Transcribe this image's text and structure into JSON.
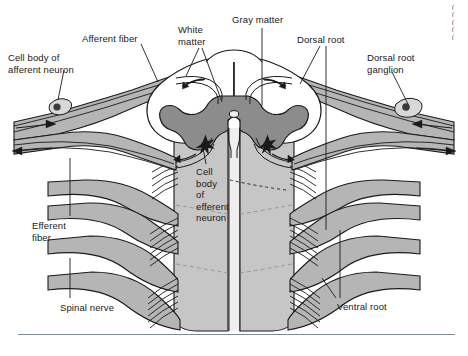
{
  "figure": {
    "background_color": "#ffffff",
    "width": 468,
    "height": 356
  },
  "colors": {
    "gray_matter": "#8c8c8c",
    "white_matter": "#ffffff",
    "nerve_fill": "#b5b5b5",
    "cord_body": "#c6c6c6",
    "outline": "#1a1a1a",
    "rule": "#7e8a91",
    "text": "#1a1a1a"
  },
  "labels": [
    {
      "id": "cell-body-afferent-neuron",
      "text": "Cell body of\nafferent neuron",
      "x": 8,
      "y": 52,
      "align": "left"
    },
    {
      "id": "afferent-fiber",
      "text": "Afferent fiber",
      "x": 82,
      "y": 33,
      "align": "left"
    },
    {
      "id": "white-matter",
      "text": "White\nmatter",
      "x": 178,
      "y": 24,
      "align": "left"
    },
    {
      "id": "gray-matter",
      "text": "Gray matter",
      "x": 232,
      "y": 14,
      "align": "left"
    },
    {
      "id": "dorsal-root",
      "text": "Dorsal root",
      "x": 297,
      "y": 34,
      "align": "left"
    },
    {
      "id": "dorsal-root-ganglion",
      "text": "Dorsal root\nganglion",
      "x": 367,
      "y": 52,
      "align": "left"
    },
    {
      "id": "cell-body-efferent-neuron",
      "text": "Cell\nbody\nof\nefferent\nneuron",
      "x": 196,
      "y": 166,
      "align": "left"
    },
    {
      "id": "efferent-fiber",
      "text": "Efferent\nfiber",
      "x": 32,
      "y": 220,
      "align": "left"
    },
    {
      "id": "spinal-nerve",
      "text": "Spinal nerve",
      "x": 60,
      "y": 302,
      "align": "left"
    },
    {
      "id": "ventral-root",
      "text": "Ventral root",
      "x": 337,
      "y": 301,
      "align": "left"
    }
  ],
  "credit": {
    "text": "(\n(\n(\n(\n("
  },
  "anatomy": {
    "structures": [
      "dorsal horn (gray matter)",
      "ventral horn (gray matter)",
      "central canal",
      "white matter columns",
      "dorsal root",
      "dorsal root ganglion",
      "ventral root",
      "spinal nerve",
      "afferent fiber",
      "efferent fiber",
      "cell body of afferent neuron",
      "cell body of efferent neuron",
      "synapse (star)"
    ],
    "signal_arrows": [
      {
        "name": "afferent-inflow-left",
        "direction": "toward cord"
      },
      {
        "name": "efferent-outflow-left",
        "direction": "away from cord"
      },
      {
        "name": "afferent-inflow-right",
        "direction": "toward cord"
      },
      {
        "name": "efferent-outflow-right",
        "direction": "away from cord"
      }
    ]
  }
}
